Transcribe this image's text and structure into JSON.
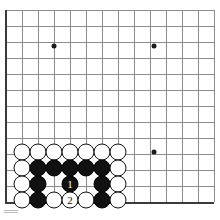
{
  "figure": {
    "kind": "go-board-diagram",
    "board": {
      "line_color": "#8c8c8c",
      "edge_color": "#3a3a3a",
      "background_color": "#ffffff",
      "spacing": 16,
      "origin_x": 6,
      "origin_y": 10,
      "columns": 14,
      "rows": 13,
      "left_edge_x": 6,
      "top_edge_y": 10,
      "bottom_edge_y": 202,
      "vertical_lines_x": [
        6,
        22,
        38,
        54,
        70,
        86,
        102,
        118,
        134,
        150,
        166,
        182,
        198,
        214
      ],
      "horizontal_lines_y": [
        10,
        26,
        42,
        58,
        74,
        90,
        106,
        122,
        138,
        154,
        170,
        186,
        202
      ],
      "has_left_edge": true,
      "has_bottom_edge": true,
      "has_top_edge": false,
      "has_right_edge": false
    },
    "star_points": [
      {
        "name": "star-point-upper-left",
        "x": 54,
        "y": 46
      },
      {
        "name": "star-point-upper-right",
        "x": 154,
        "y": 46
      },
      {
        "name": "star-point-lower-right",
        "x": 154,
        "y": 152
      }
    ],
    "stone_colors": {
      "black": "#111111",
      "white": "#ffffff",
      "outline": "#111111",
      "black_label": "#ffffff",
      "white_label": "#111111"
    },
    "stones": [
      {
        "name": "stone-white-r1c1",
        "color": "white",
        "x": 22,
        "y": 152,
        "label": ""
      },
      {
        "name": "stone-white-r1c2",
        "color": "white",
        "x": 38,
        "y": 152,
        "label": ""
      },
      {
        "name": "stone-white-r1c3",
        "color": "white",
        "x": 54,
        "y": 152,
        "label": ""
      },
      {
        "name": "stone-white-r1c4",
        "color": "white",
        "x": 70,
        "y": 152,
        "label": ""
      },
      {
        "name": "stone-white-r1c5",
        "color": "white",
        "x": 86,
        "y": 152,
        "label": ""
      },
      {
        "name": "stone-white-r1c6",
        "color": "white",
        "x": 102,
        "y": 152,
        "label": ""
      },
      {
        "name": "stone-white-r1c7",
        "color": "white",
        "x": 118,
        "y": 152,
        "label": ""
      },
      {
        "name": "stone-white-r2c1",
        "color": "white",
        "x": 22,
        "y": 168,
        "label": ""
      },
      {
        "name": "stone-black-r2c2",
        "color": "black",
        "x": 38,
        "y": 168,
        "label": ""
      },
      {
        "name": "stone-black-r2c3",
        "color": "black",
        "x": 54,
        "y": 168,
        "label": ""
      },
      {
        "name": "stone-black-r2c4",
        "color": "black",
        "x": 70,
        "y": 168,
        "label": ""
      },
      {
        "name": "stone-black-r2c5",
        "color": "black",
        "x": 86,
        "y": 168,
        "label": ""
      },
      {
        "name": "stone-black-r2c6",
        "color": "black",
        "x": 102,
        "y": 168,
        "label": ""
      },
      {
        "name": "stone-white-r2c7",
        "color": "white",
        "x": 118,
        "y": 168,
        "label": ""
      },
      {
        "name": "stone-white-r3c1",
        "color": "white",
        "x": 22,
        "y": 184,
        "label": ""
      },
      {
        "name": "stone-black-r3c2",
        "color": "black",
        "x": 38,
        "y": 184,
        "label": ""
      },
      {
        "name": "stone-black-move-1",
        "color": "black",
        "x": 70,
        "y": 184,
        "label": "1"
      },
      {
        "name": "stone-black-r3c6",
        "color": "black",
        "x": 102,
        "y": 184,
        "label": ""
      },
      {
        "name": "stone-white-r3c7",
        "color": "white",
        "x": 118,
        "y": 184,
        "label": ""
      },
      {
        "name": "stone-white-r4c1",
        "color": "white",
        "x": 22,
        "y": 200,
        "label": ""
      },
      {
        "name": "stone-black-r4c2",
        "color": "black",
        "x": 38,
        "y": 200,
        "label": ""
      },
      {
        "name": "stone-white-r4c3",
        "color": "white",
        "x": 54,
        "y": 200,
        "label": ""
      },
      {
        "name": "stone-white-move-2",
        "color": "white",
        "x": 70,
        "y": 200,
        "label": "2"
      },
      {
        "name": "stone-white-r4c5",
        "color": "white",
        "x": 86,
        "y": 200,
        "label": ""
      },
      {
        "name": "stone-black-r4c6",
        "color": "black",
        "x": 102,
        "y": 200,
        "label": ""
      },
      {
        "name": "stone-white-r4c7",
        "color": "white",
        "x": 118,
        "y": 200,
        "label": ""
      }
    ],
    "move_sequence": [
      {
        "number": "1",
        "color": "black"
      },
      {
        "number": "2",
        "color": "white"
      }
    ]
  }
}
